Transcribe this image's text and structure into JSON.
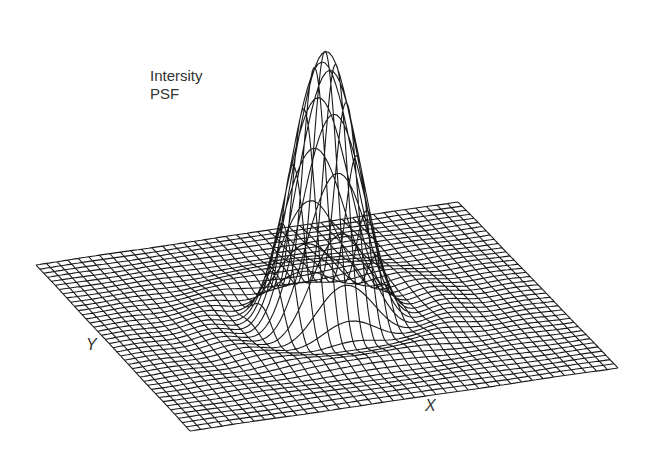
{
  "figure": {
    "annotation_line1": "Intersity",
    "annotation_line2": "PSF",
    "x_axis_label": "X",
    "y_axis_label": "Y"
  },
  "surface": {
    "type": "wireframe-3d",
    "function": "airy-intensity-psf",
    "grid_lines": 40,
    "base_corners_px": {
      "left": [
        36,
        265
      ],
      "back": [
        458,
        202
      ],
      "right": [
        618,
        368
      ],
      "front": [
        190,
        431
      ]
    },
    "peak_height_px": 265,
    "line_color": "#1a1a1a",
    "background": "#ffffff"
  }
}
